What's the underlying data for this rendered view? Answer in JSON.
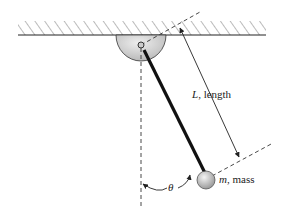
{
  "diagram": {
    "labels": {
      "length_var": "L",
      "length_text": ", length",
      "mass_var": "m",
      "mass_text": ", mass",
      "angle": "θ"
    },
    "colors": {
      "line": "#222222",
      "pivot_fill": "#d8d8d8",
      "mass_fill": "#cccccc",
      "hatch": "#555555"
    }
  }
}
